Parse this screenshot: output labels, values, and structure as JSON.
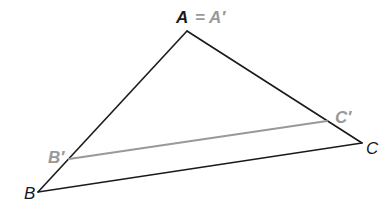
{
  "diagram": {
    "type": "geometry-dilation",
    "colors": {
      "original": "#1a1a1a",
      "image": "#999999",
      "background": "#ffffff"
    },
    "points": {
      "A": {
        "x": 187,
        "y": 31,
        "label": "A"
      },
      "B": {
        "x": 38,
        "y": 192,
        "label": "B"
      },
      "C": {
        "x": 362,
        "y": 143,
        "label": "C"
      },
      "B_prime": {
        "x": 69,
        "y": 159,
        "label": "B′"
      },
      "C_prime": {
        "x": 327,
        "y": 121,
        "label": "C′"
      }
    },
    "labels": {
      "A": "A",
      "equals": "=",
      "A_prime": "A′",
      "B": "B",
      "C": "C",
      "B_prime": "B′",
      "C_prime": "C′"
    },
    "segments": [
      {
        "from": "A",
        "to": "B",
        "style": "original"
      },
      {
        "from": "A",
        "to": "C",
        "style": "original"
      },
      {
        "from": "B",
        "to": "C",
        "style": "original"
      },
      {
        "from": "B_prime",
        "to": "C_prime",
        "style": "image"
      }
    ]
  }
}
